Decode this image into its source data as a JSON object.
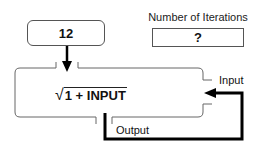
{
  "input_box": {
    "value": "12"
  },
  "iterations": {
    "label": "Number of Iterations",
    "value": "?"
  },
  "function_machine": {
    "radical_symbol": "√",
    "expression": "1 + INPUT"
  },
  "ports": {
    "input_label": "Input",
    "output_label": "Output"
  },
  "colors": {
    "stroke": "#555555",
    "feedback_path": "#000000",
    "text": "#111111"
  }
}
